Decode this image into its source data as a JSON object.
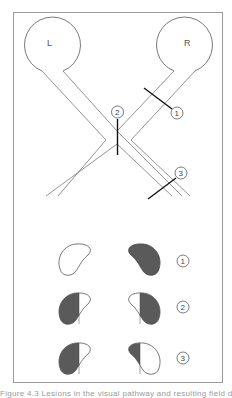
{
  "diagram": {
    "type": "visual pathway lesion diagram",
    "eyes": [
      {
        "id": "left",
        "label": "L"
      },
      {
        "id": "right",
        "label": "R"
      }
    ],
    "lesions": [
      {
        "id": 1,
        "label": "1",
        "location": "right optic nerve"
      },
      {
        "id": 2,
        "label": "2",
        "location": "optic chiasm (midline)"
      },
      {
        "id": 3,
        "label": "3",
        "location": "right optic tract"
      }
    ],
    "field_defects": [
      {
        "row": 1,
        "label": "1",
        "left_eye": "normal (unfilled)",
        "right_eye": "complete loss (filled)"
      },
      {
        "row": 2,
        "label": "2",
        "left_eye": "temporal half filled",
        "right_eye": "temporal half filled"
      },
      {
        "row": 3,
        "label": "3",
        "left_eye": "left half filled",
        "right_eye": "left half filled"
      }
    ],
    "colors": {
      "stroke": "#555555",
      "lesion_line": "#111111",
      "defect_fill": "#5a5a5a",
      "frame": "#9a9a9a",
      "background": "#ffffff"
    }
  },
  "caption": {
    "text": "Figure 4.3  Lesions in the visual pathway and resulting field defects",
    "truncated": true
  }
}
